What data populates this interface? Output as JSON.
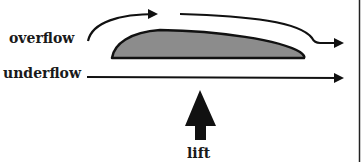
{
  "diagram": {
    "labels": {
      "overflow": "overflow",
      "underflow": "underflow",
      "lift": "lift"
    },
    "elements": {
      "airfoil": "wing cross-section (airfoil), gray filled",
      "overflow_arrows": "curved arrows passing over the top of the airfoil",
      "underflow_arrow": "straight arrow passing under the airfoil",
      "lift_arrow": "thick upward arrow beneath the airfoil"
    },
    "colors": {
      "stroke": "#111111",
      "airfoil_fill": "#8c8c8c",
      "background": "#ffffff"
    }
  }
}
